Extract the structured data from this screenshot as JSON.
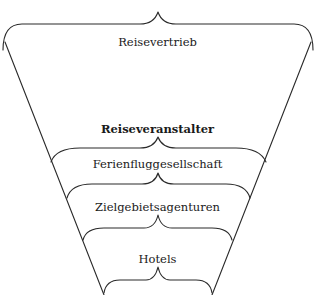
{
  "diagram": {
    "type": "funnel-with-braces",
    "stroke_color": "#2a2a2a",
    "text_color": "#1a1a1a",
    "levels": [
      {
        "label": "Reisevertrieb",
        "bold": false
      },
      {
        "label": "Reiseveranstalter",
        "bold": true
      },
      {
        "label": "Ferienfluggesellschaft",
        "bold": false
      },
      {
        "label": "Zielgebietsagenturen",
        "bold": false
      },
      {
        "label": "Hotels",
        "bold": false
      }
    ]
  }
}
